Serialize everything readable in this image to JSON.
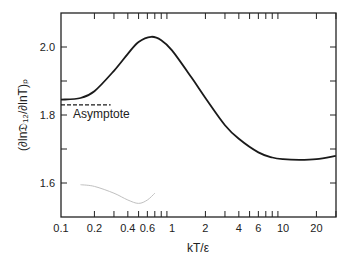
{
  "chart_data": {
    "type": "line",
    "title": "",
    "xlabel": "kT/ε",
    "ylabel": "(∂ln𝔇₁₂/∂lnT)ₚ",
    "x_scale": "log",
    "xlim": [
      0.1,
      30
    ],
    "ylim": [
      1.5,
      2.1
    ],
    "x_ticks": [
      "0.1",
      "0.2",
      "0.4",
      "0.6",
      "1",
      "2",
      "4",
      "6",
      "10",
      "20"
    ],
    "y_ticks": [
      "1.6",
      "1.8",
      "2.0"
    ],
    "grid": false,
    "series": [
      {
        "name": "main curve",
        "color": "#1a1a1a",
        "x": [
          0.1,
          0.15,
          0.2,
          0.3,
          0.4,
          0.5,
          0.65,
          0.8,
          1.0,
          1.5,
          2,
          3,
          4,
          6,
          8,
          10,
          14,
          20,
          30
        ],
        "y": [
          1.845,
          1.85,
          1.87,
          1.93,
          1.98,
          2.015,
          2.03,
          2.02,
          1.99,
          1.91,
          1.85,
          1.77,
          1.73,
          1.69,
          1.675,
          1.67,
          1.668,
          1.67,
          1.68
        ]
      },
      {
        "name": "faint curve",
        "color": "#bbbbbb",
        "x": [
          0.15,
          0.2,
          0.3,
          0.4,
          0.5,
          0.6,
          0.7
        ],
        "y": [
          1.595,
          1.59,
          1.57,
          1.55,
          1.54,
          1.55,
          1.57
        ]
      },
      {
        "name": "Asymptote",
        "style": "dashed",
        "color": "#1a1a1a",
        "x": [
          0.1,
          0.28
        ],
        "y": [
          1.83,
          1.83
        ]
      }
    ],
    "annotations": [
      {
        "text": "Asymptote",
        "x": 0.11,
        "y": 1.81
      }
    ]
  },
  "labels": {
    "asymptote": "Asymptote",
    "xlabel": "kT/ε",
    "ylabel": "(∂ln𝔇₁₂/∂lnT)ₚ"
  },
  "x_ticks": [
    {
      "label": "0.1",
      "v": 0.1
    },
    {
      "label": "0.2",
      "v": 0.2
    },
    {
      "label": "0.4",
      "v": 0.4
    },
    {
      "label": "0.6",
      "v": 0.6
    },
    {
      "label": "1",
      "v": 1
    },
    {
      "label": "2",
      "v": 2
    },
    {
      "label": "4",
      "v": 4
    },
    {
      "label": "6",
      "v": 6
    },
    {
      "label": "10",
      "v": 10
    },
    {
      "label": "20",
      "v": 20
    }
  ],
  "y_ticks": [
    {
      "label": "1.6",
      "v": 1.6
    },
    {
      "label": "1.8",
      "v": 1.8
    },
    {
      "label": "2.0",
      "v": 2.0
    }
  ]
}
